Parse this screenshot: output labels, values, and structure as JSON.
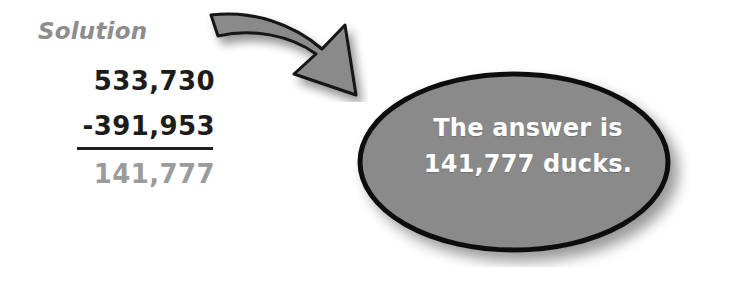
{
  "page": {
    "background_color": "#ffffff",
    "width": 736,
    "height": 281
  },
  "solution": {
    "heading": "Solution",
    "heading_color": "#8d8d8d",
    "minuend": "533,730",
    "subtrahend": "-391,953",
    "difference": "141,777",
    "minuend_color": "#1c1c1c",
    "subtrahend_color": "#1c1c1c",
    "difference_color": "#9b9b9b",
    "rule_color": "#1f1f1f"
  },
  "arrow": {
    "name": "curved-arrow-icon",
    "direction": "down-right",
    "fill_color": "#8a8a8a",
    "outline_color": "#141414",
    "has_shadow": true
  },
  "callout": {
    "shape": "ellipse",
    "fill_color": "#8a8a8a",
    "outline_color": "#111111",
    "text_color": "#ffffff",
    "has_shadow": true,
    "lines": [
      "The answer is",
      "141,777 ducks."
    ]
  }
}
